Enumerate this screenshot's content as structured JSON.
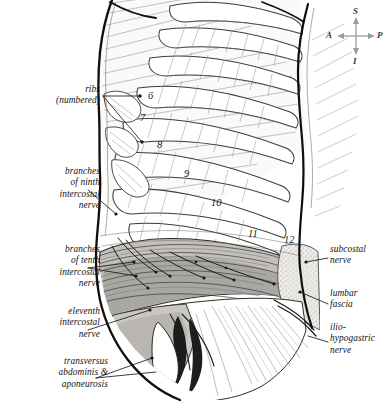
{
  "figure": {
    "kind": "anatomical-illustration",
    "style": "pen-and-ink line drawing with gray wash"
  },
  "orientation_compass": {
    "name": "anatomical-orientation-compass",
    "superior": "S",
    "inferior": "I",
    "anterior": "A",
    "posterior": "P",
    "color": "#9a9a9a"
  },
  "labels_left": [
    {
      "id": "ribs-numbered",
      "text": "ribs\n(numbered)"
    },
    {
      "id": "ninth-intercostal-nerve",
      "text": "branches\nof ninth\nintercostal\nnerve"
    },
    {
      "id": "tenth-intercostal-nerve",
      "text": "branches\nof tenth\nintercostal\nnerve"
    },
    {
      "id": "eleventh-intercostal-nerve",
      "text": "eleventh\nintercostal\nnerve"
    },
    {
      "id": "transversus-abdominis",
      "text": "transversus\nabdominis &\naponeurosis"
    }
  ],
  "labels_right": [
    {
      "id": "subcostal-nerve",
      "text": "subcostal\nnerve"
    },
    {
      "id": "lumbar-fascia",
      "text": "lumbar\nfascia"
    },
    {
      "id": "iliohypogastric-nerve",
      "text": "ilio-\nhypogastric\nnerve"
    }
  ],
  "rib_numbers": [
    "6",
    "7",
    "8",
    "9",
    "10",
    "11",
    "12"
  ],
  "palette": {
    "ink": "#111111",
    "midline": "#4a4a4a",
    "hatch": "#8c8c8c",
    "wash_light": "#e4e2df",
    "wash_mid": "#bfbcb8",
    "wash_dark": "#9a9794",
    "stipple": "#cfcbc6",
    "paper": "#ffffff"
  }
}
